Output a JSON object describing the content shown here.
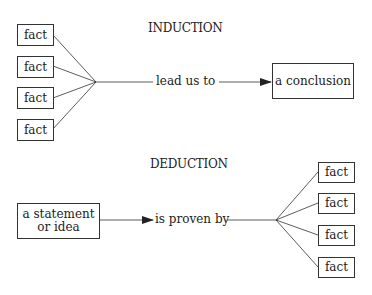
{
  "induction": {
    "title": "INDUCTION",
    "facts": [
      "fact",
      "fact",
      "fact",
      "fact"
    ],
    "connector_label": "lead us to",
    "result": "a conclusion"
  },
  "deduction": {
    "title": "DEDUCTION",
    "source_line1": "a statement",
    "source_line2": "or idea",
    "connector_label": "is proven by",
    "facts": [
      "fact",
      "fact",
      "fact",
      "fact"
    ]
  }
}
